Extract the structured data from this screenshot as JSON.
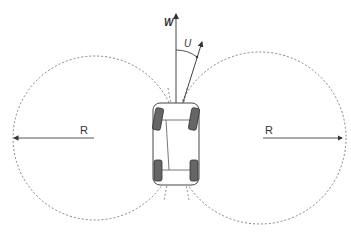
{
  "diagram": {
    "type": "vehicle turning radius diagram",
    "labels": {
      "w_axis": "W",
      "u_angle": "U",
      "left_radius": "R",
      "right_radius": "R"
    },
    "colors": {
      "line": "#444444",
      "dashed_circle": "#666666",
      "tire": "#555555",
      "background": "#ffffff"
    }
  }
}
